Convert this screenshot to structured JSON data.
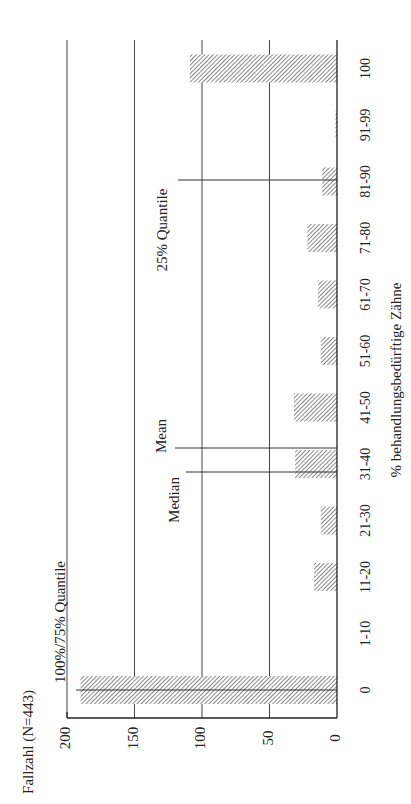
{
  "chart_data": {
    "type": "bar",
    "orientation": "rotated-90-ccw",
    "title": "Fallzahl (N=443)",
    "xlabel": "% behandlungsbedürftige Zähne",
    "ylabel": "Fallzahl (N=443)",
    "categories": [
      "0",
      "1-10",
      "11-20",
      "21-30",
      "31-40",
      "41-50",
      "51-60",
      "61-70",
      "71-80",
      "81-90",
      "91-99",
      "100"
    ],
    "values": [
      190,
      0,
      17,
      12,
      31,
      32,
      12,
      14,
      22,
      11,
      1,
      109
    ],
    "ylim": [
      0,
      200
    ],
    "yticks": [
      0,
      50,
      100,
      150,
      200
    ],
    "grid": true,
    "annotations": [
      {
        "label": "100%/75% Quantile",
        "position": "0"
      },
      {
        "label": "Median",
        "position": "31-40 (lower)"
      },
      {
        "label": "Mean",
        "position": "31-40 (upper)"
      },
      {
        "label": "25% Quantile",
        "position": "81-90"
      }
    ]
  }
}
